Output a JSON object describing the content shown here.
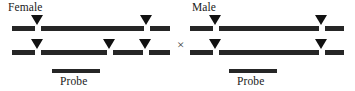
{
  "figure": {
    "width": 355,
    "height": 91,
    "background": "#ffffff",
    "ink_color": "#262626",
    "marker_color": "#111111"
  },
  "cross": {
    "symbol": "×",
    "x": 177,
    "y": 38
  },
  "parents": [
    {
      "id": "female",
      "label": "Female",
      "label_x": 8,
      "label_y": 2,
      "probe": {
        "label": "Probe",
        "label_x": 60,
        "label_y": 76,
        "bar_x": 52,
        "bar_y": 69,
        "bar_width": 48
      },
      "chromosomes": [
        {
          "id": "female-homolog-1",
          "y": 26,
          "segments": [
            {
              "x": 12,
              "width": 23
            },
            {
              "x": 41,
              "width": 103
            },
            {
              "x": 150,
              "width": 20
            }
          ],
          "sites": [
            {
              "x": 31,
              "y": 15
            },
            {
              "x": 140,
              "y": 15
            }
          ]
        },
        {
          "id": "female-homolog-2",
          "y": 50,
          "segments": [
            {
              "x": 12,
              "width": 23
            },
            {
              "x": 41,
              "width": 66
            },
            {
              "x": 113,
              "width": 30
            },
            {
              "x": 149,
              "width": 21
            }
          ],
          "sites": [
            {
              "x": 31,
              "y": 39
            },
            {
              "x": 103,
              "y": 39
            },
            {
              "x": 139,
              "y": 39
            }
          ]
        }
      ]
    },
    {
      "id": "male",
      "label": "Male",
      "label_x": 192,
      "label_y": 2,
      "probe": {
        "label": "Probe",
        "label_x": 237,
        "label_y": 76,
        "bar_x": 229,
        "bar_y": 69,
        "bar_width": 48
      },
      "chromosomes": [
        {
          "id": "male-homolog-1",
          "y": 26,
          "segments": [
            {
              "x": 190,
              "width": 23
            },
            {
              "x": 219,
              "width": 100
            },
            {
              "x": 325,
              "width": 19
            }
          ],
          "sites": [
            {
              "x": 209,
              "y": 15
            },
            {
              "x": 315,
              "y": 15
            }
          ]
        },
        {
          "id": "male-homolog-2",
          "y": 50,
          "segments": [
            {
              "x": 190,
              "width": 23
            },
            {
              "x": 219,
              "width": 100
            },
            {
              "x": 325,
              "width": 19
            }
          ],
          "sites": [
            {
              "x": 209,
              "y": 39
            },
            {
              "x": 315,
              "y": 39
            }
          ]
        }
      ]
    }
  ]
}
